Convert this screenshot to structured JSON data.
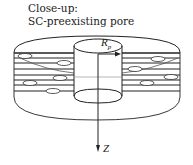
{
  "caption": {
    "line1": "Close-up:",
    "line2": "SC-preexisting pore"
  },
  "diagram": {
    "radius_label": "R",
    "radius_subscript": "p",
    "axis_label": "Z",
    "elements": [
      "outer-disk",
      "stacked-lamellae",
      "vesicles",
      "cylindrical-pore",
      "radius-arrow",
      "z-axis-arrow"
    ]
  },
  "colors": {
    "stroke": "#222222",
    "background": "#ffffff"
  }
}
